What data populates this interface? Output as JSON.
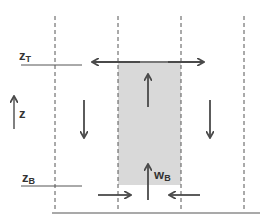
{
  "diagram": {
    "labels": {
      "z_top": {
        "main": "z",
        "sub": "T"
      },
      "z_bottom": {
        "main": "z",
        "sub": "B"
      },
      "z_axis": "z",
      "w_bottom": {
        "main": "w",
        "sub": "B"
      }
    },
    "colors": {
      "stroke": "#4a4a4a",
      "box_fill": "#d9d9d9",
      "background": "#ffffff"
    }
  }
}
